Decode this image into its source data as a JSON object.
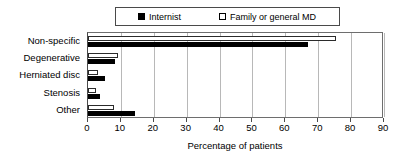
{
  "chart_data": {
    "type": "bar",
    "orientation": "horizontal",
    "title": "",
    "xlabel": "Percentage of patients",
    "ylabel": "",
    "xlim": [
      0,
      90
    ],
    "xticks": [
      0,
      10,
      20,
      30,
      40,
      50,
      60,
      70,
      80,
      90
    ],
    "grid": true,
    "legend_position": "top",
    "categories": [
      "Non-specific",
      "Degenerative",
      "Herniated disc",
      "Stenosis",
      "Other"
    ],
    "series": [
      {
        "name": "Internist",
        "marker": "filled-square",
        "color": "#000000",
        "values": [
          67.0,
          8.3,
          5.3,
          3.8,
          14.3
        ]
      },
      {
        "name": "Family or general MD",
        "marker": "open-square",
        "color": "#ffffff",
        "values": [
          75.5,
          9.0,
          3.0,
          2.3,
          8.0
        ]
      }
    ]
  },
  "legend": {
    "entries": [
      {
        "label": "Internist"
      },
      {
        "label": "Family or general MD"
      }
    ]
  },
  "axis": {
    "xlabel": "Percentage of patients"
  }
}
